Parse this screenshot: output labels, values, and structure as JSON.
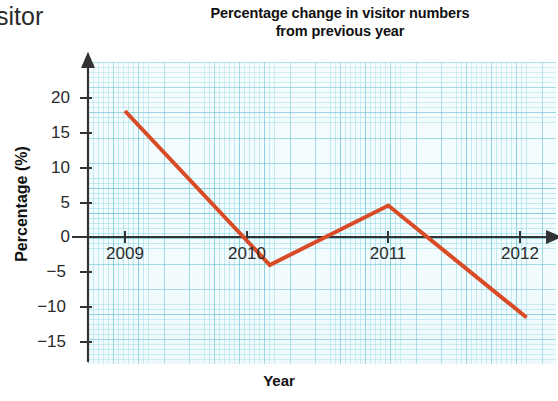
{
  "page": {
    "cropped_text_fragment": "sitor"
  },
  "chart_data": {
    "type": "line",
    "title": "Percentage change in visitor numbers from previous year",
    "title_line1": "Percentage change in visitor numbers",
    "title_line2": "from previous year",
    "xlabel": "Year",
    "ylabel": "Percentage (%)",
    "categories": [
      "2009",
      "2010",
      "2011",
      "2012"
    ],
    "x": [
      2009,
      2010,
      2011,
      2012
    ],
    "series": [
      {
        "name": "Percentage change",
        "color": "#d94a26",
        "values": [
          18,
          -4,
          4.5,
          -11.5
        ]
      }
    ],
    "vertices": [
      {
        "x": 2009.0,
        "y": 18
      },
      {
        "x": 2010.1,
        "y": -4
      },
      {
        "x": 2011.0,
        "y": 4.5
      },
      {
        "x": 2012.05,
        "y": -11.5
      }
    ],
    "ylim": [
      -18,
      22
    ],
    "xlim": [
      2008.7,
      2012.4
    ],
    "yticks": [
      20,
      15,
      10,
      5,
      0,
      -5,
      -10,
      -15
    ],
    "ytick_labels": [
      "20",
      "15",
      "10",
      "5",
      "0",
      "−5",
      "−10",
      "−15"
    ],
    "xticks": [
      2009,
      2010,
      2011,
      2012
    ],
    "xtick_labels": [
      "2009",
      "2010",
      "2011",
      "2012"
    ],
    "grid": true,
    "grid_style": "graph-paper",
    "grid_color": "#78cddc",
    "legend": false,
    "axis_color": "#333333",
    "axis_arrows": [
      "x-right",
      "y-up"
    ],
    "background": "#f2fbfd"
  }
}
